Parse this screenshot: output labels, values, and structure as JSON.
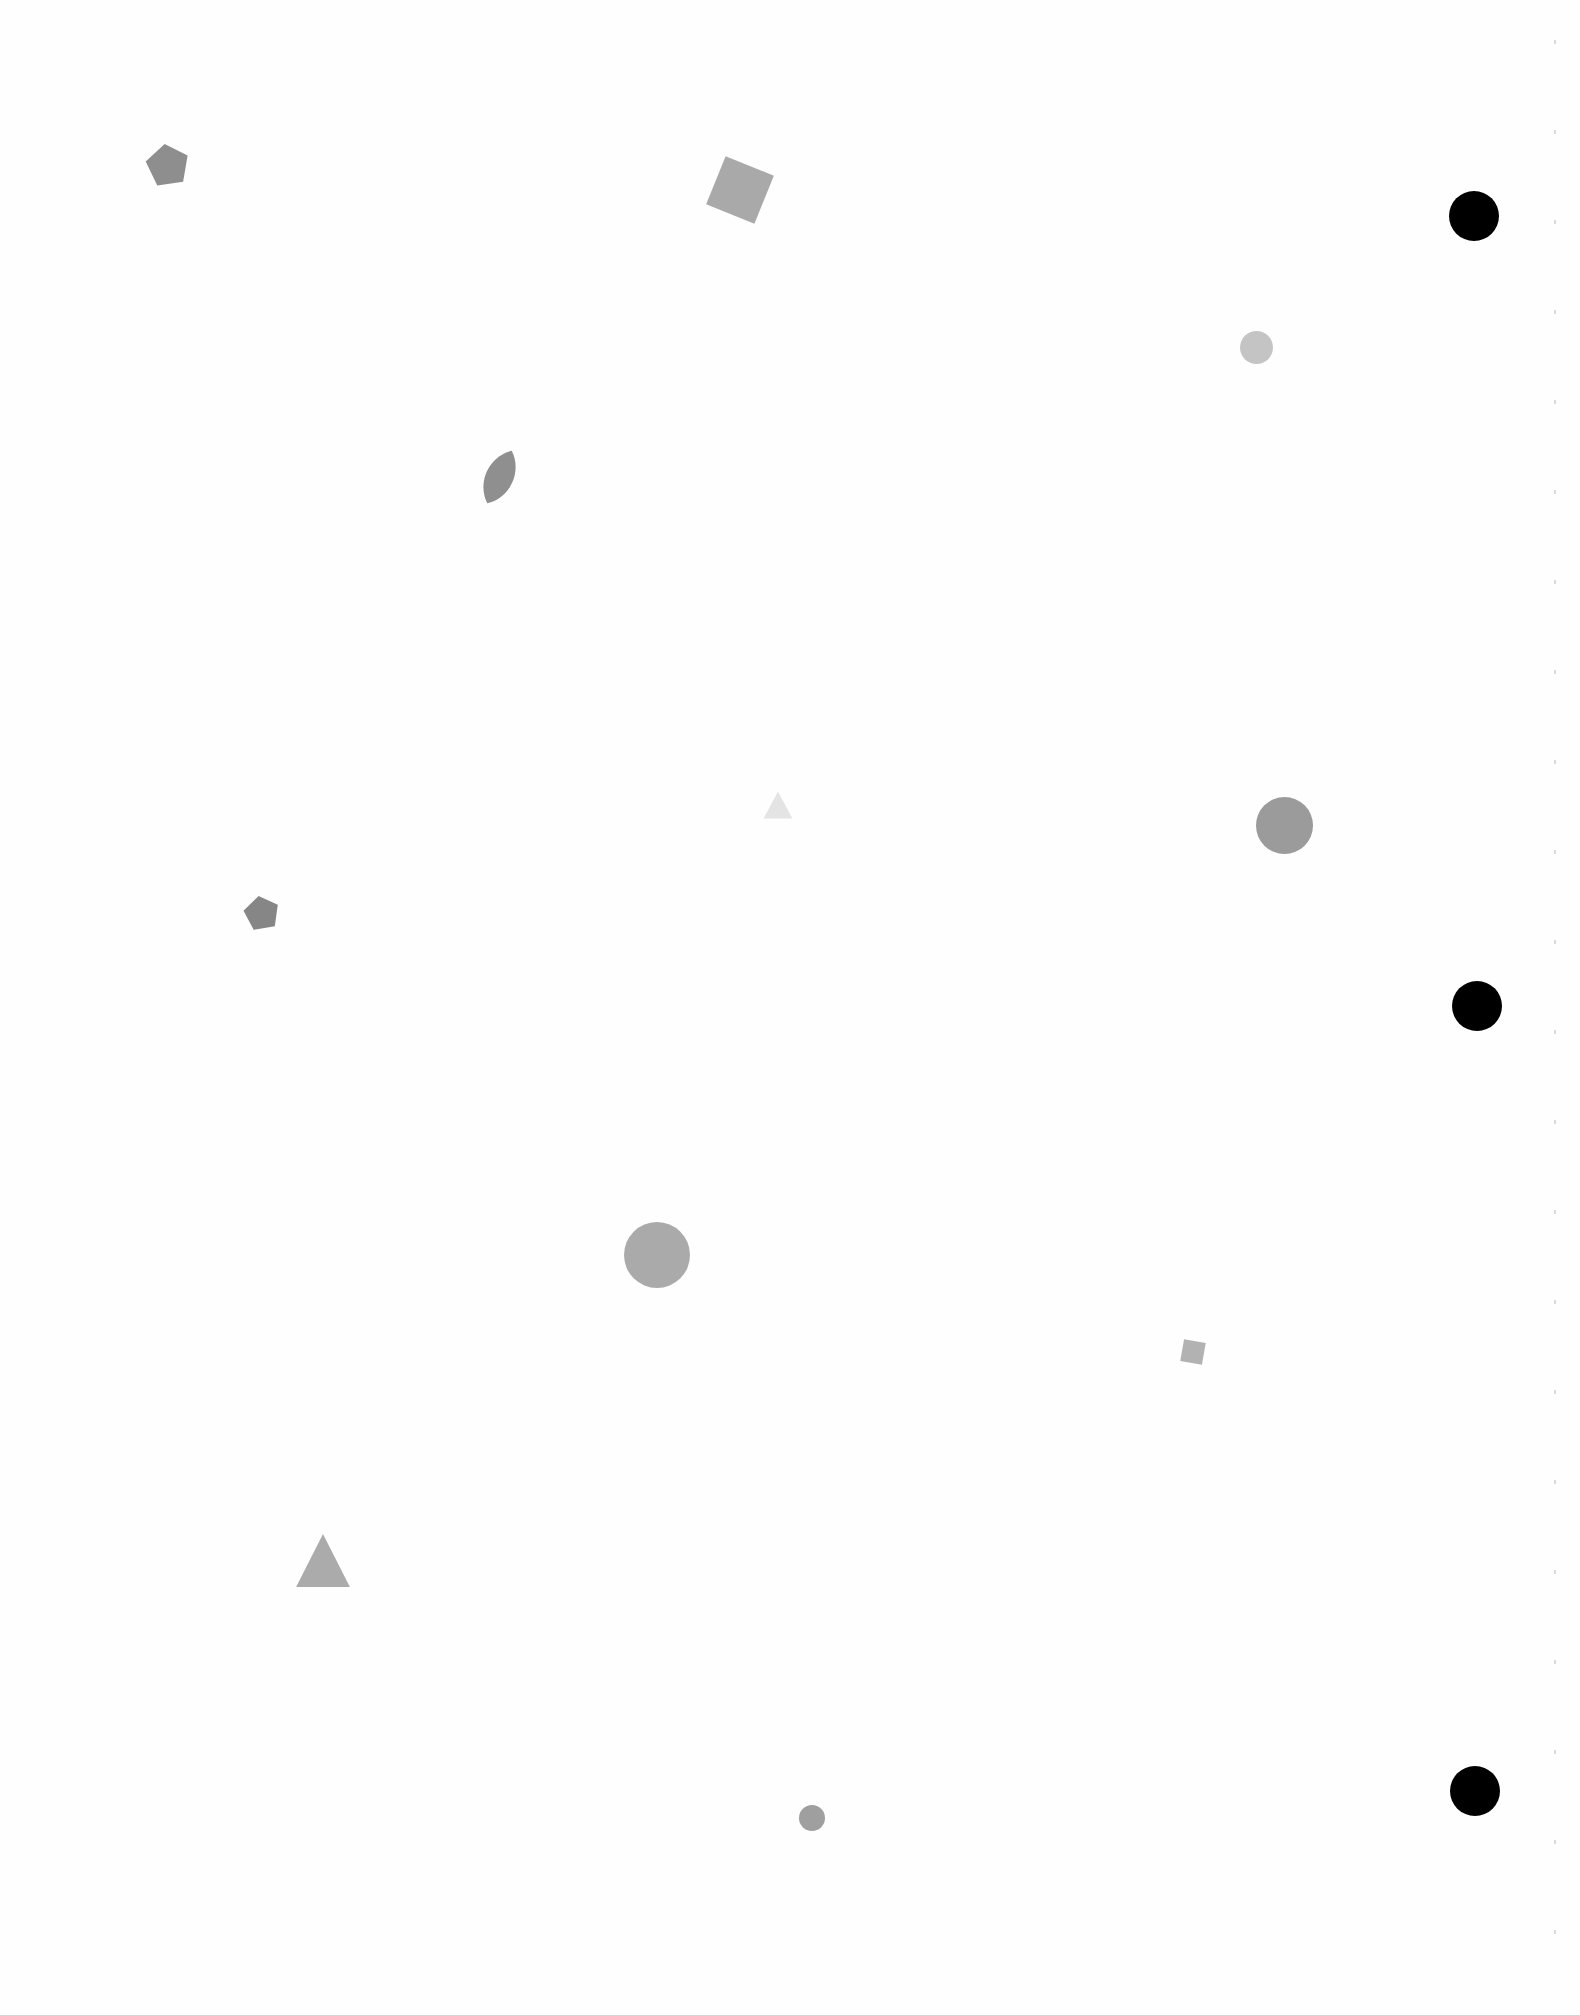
{
  "page": {
    "background": "#fefefe"
  },
  "punch_holes": [
    {
      "cx": 1474,
      "cy": 216,
      "r": 25,
      "color": "#000000"
    },
    {
      "cx": 1477,
      "cy": 1006,
      "r": 25,
      "color": "#000000"
    },
    {
      "cx": 1475,
      "cy": 1791,
      "r": 25,
      "color": "#000000"
    }
  ],
  "shapes": [
    {
      "type": "pentagon",
      "x": 145,
      "y": 143,
      "w": 45,
      "h": 43,
      "rotate": -8,
      "color": "#8e8e8e"
    },
    {
      "type": "square",
      "x": 714,
      "y": 164,
      "w": 52,
      "h": 52,
      "rotate": 22,
      "color": "#a9a9a9"
    },
    {
      "type": "circle",
      "x": 1240,
      "y": 331,
      "w": 33,
      "h": 33,
      "rotate": 0,
      "color": "#c4c4c4"
    },
    {
      "type": "leaf",
      "x": 479,
      "y": 448,
      "w": 41,
      "h": 58,
      "rotate": 25,
      "color": "#8f8f8f"
    },
    {
      "type": "triangle",
      "x": 763,
      "y": 791,
      "w": 30,
      "h": 28,
      "rotate": 0,
      "color": "#e4e4e4"
    },
    {
      "type": "circle",
      "x": 1256,
      "y": 797,
      "w": 57,
      "h": 57,
      "rotate": 0,
      "color": "#9b9b9b"
    },
    {
      "type": "pentagon",
      "x": 243,
      "y": 895,
      "w": 37,
      "h": 35,
      "rotate": -10,
      "color": "#868686"
    },
    {
      "type": "circle",
      "x": 624,
      "y": 1222,
      "w": 66,
      "h": 66,
      "rotate": 0,
      "color": "#aaaaaa"
    },
    {
      "type": "square",
      "x": 1182,
      "y": 1341,
      "w": 22,
      "h": 22,
      "rotate": 10,
      "color": "#b2b2b2"
    },
    {
      "type": "triangle",
      "x": 295,
      "y": 1533,
      "w": 56,
      "h": 55,
      "rotate": 0,
      "color": "#ababab"
    },
    {
      "type": "circle",
      "x": 799,
      "y": 1805,
      "w": 26,
      "h": 26,
      "rotate": 0,
      "color": "#9f9f9f"
    }
  ]
}
